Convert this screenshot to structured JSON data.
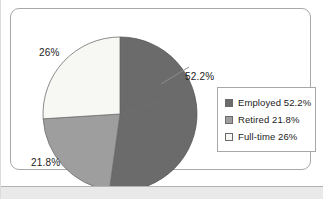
{
  "chart_data": {
    "type": "pie",
    "title": "",
    "categories": [
      "Employed",
      "Retired",
      "Full-time"
    ],
    "values": [
      52.2,
      21.8,
      26
    ],
    "value_unit": "%",
    "start_angle_deg": 0,
    "direction": "clockwise",
    "slice_labels": [
      "52.2%",
      "21.8%",
      "26%"
    ],
    "legend_entries": [
      "Employed 52.2%",
      "Retired 21.8%",
      "Full-time 26%"
    ],
    "legend_position": "right",
    "grid": false,
    "xlabel": "",
    "ylabel": "",
    "colors": [
      "#6b6b6b",
      "#9e9e9e",
      "#f7f7f4"
    ]
  },
  "chart": {
    "slices": [
      {
        "name": "Employed",
        "value": 52.2,
        "label": "52.2%",
        "color": "#6b6b6b"
      },
      {
        "name": "Retired",
        "value": 21.8,
        "label": "21.8%",
        "color": "#9e9e9e"
      },
      {
        "name": "Full-time",
        "value": 26,
        "label": "26%",
        "color": "#f7f7f4"
      }
    ],
    "labels": {
      "employed": "52.2%",
      "retired": "21.8%",
      "fulltime": "26%"
    }
  },
  "legend": {
    "items": [
      {
        "label": "Employed 52.2%",
        "swatch": "#6b6b6b",
        "icon": "legend-swatch-icon"
      },
      {
        "label": "Retired 21.8%",
        "swatch": "#9e9e9e",
        "icon": "legend-swatch-icon"
      },
      {
        "label": "Full-time 26%",
        "swatch": "#f7f7f4",
        "icon": "legend-swatch-icon"
      }
    ]
  },
  "style": {
    "frame_border": "#a8a8a8",
    "text_color": "#1c1c1c",
    "page_bg": "#ffffff",
    "band_bg": "#e9e9e9"
  }
}
